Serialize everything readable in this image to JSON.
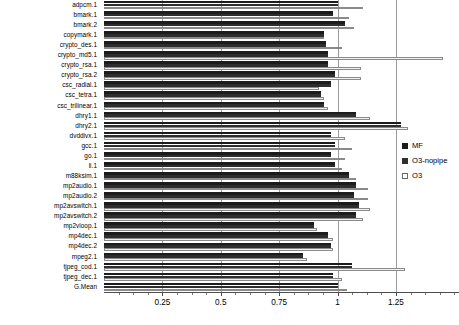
{
  "chart_data": {
    "type": "bar",
    "orientation": "horizontal",
    "title": "",
    "xlabel": "",
    "ylabel": "",
    "xlim": [
      0,
      1.52
    ],
    "xticks": [
      0.25,
      0.5,
      0.75,
      1,
      1.25
    ],
    "xtick_labels": [
      "0.25",
      "0.5",
      "0.75",
      "1",
      "1.25"
    ],
    "minor_ticks_per_interval": 4,
    "grid": true,
    "grid_axis": "x",
    "legend_position": "right",
    "categories": [
      "adpcm.1",
      "bmark.1",
      "bmark.2",
      "copymark.1",
      "crypto_des.1",
      "crypto_md5.1",
      "crypto_rsa.1",
      "crypto_rsa.2",
      "csc_radial.1",
      "csc_tetra.1",
      "csc_trilinear.1",
      "dhry1.1",
      "dhry2.1",
      "dvddivx.1",
      "gcc.1",
      "go.1",
      "li.1",
      "m88ksim.1",
      "mp2audio.1",
      "mp2audio.2",
      "mp2avswitch.1",
      "mp2avswitch.2",
      "mp2vloop.1",
      "mp4dec.1",
      "mp4dec.2",
      "mpeg2.1",
      "tjpeg_cod.1",
      "tjpeg_dec.1",
      "G.Mean"
    ],
    "series": [
      {
        "name": "MF",
        "color": "#1c1c1c",
        "values": [
          1.0,
          0.98,
          1.03,
          0.94,
          0.95,
          0.96,
          0.96,
          0.99,
          0.97,
          0.93,
          0.94,
          1.08,
          1.27,
          0.97,
          0.99,
          0.97,
          0.99,
          1.05,
          1.08,
          1.07,
          1.09,
          1.08,
          0.9,
          0.96,
          0.97,
          0.85,
          1.06,
          0.98,
          1.0
        ]
      },
      {
        "name": "O3-nopipe",
        "color": "#2e2e2e",
        "values": [
          1.0,
          0.98,
          1.03,
          0.94,
          0.95,
          0.96,
          0.96,
          0.99,
          0.97,
          0.93,
          0.94,
          1.08,
          1.27,
          0.97,
          0.99,
          0.97,
          0.99,
          1.05,
          1.08,
          1.07,
          1.09,
          1.08,
          0.9,
          0.96,
          0.97,
          0.85,
          1.06,
          0.98,
          1.0
        ]
      },
      {
        "name": "O3",
        "color": "#f2f2f2",
        "values": [
          1.11,
          1.05,
          1.07,
          0.94,
          1.02,
          1.45,
          1.1,
          1.1,
          0.92,
          0.94,
          0.96,
          1.14,
          1.3,
          1.03,
          1.06,
          1.03,
          1.02,
          1.08,
          1.13,
          1.13,
          1.14,
          1.11,
          0.91,
          0.98,
          0.98,
          0.87,
          1.29,
          1.02,
          1.04
        ]
      }
    ]
  },
  "legend": {
    "items": [
      {
        "label": "MF",
        "style": "mf"
      },
      {
        "label": "O3-nopipe",
        "style": "nopipe"
      },
      {
        "label": "O3",
        "style": "o3"
      }
    ]
  }
}
